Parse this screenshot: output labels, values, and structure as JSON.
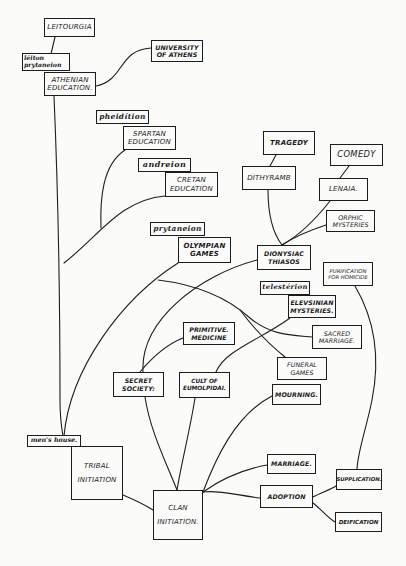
{
  "diagram": {
    "type": "genealogy-tree of Greek social institutions",
    "colors": {
      "ink": "#1c1c1c",
      "paper": "#fbfbfa"
    },
    "nodes": {
      "leitourgia": "LEITOURGIA",
      "leiton_prytaneion": "léiton\nprytaneion",
      "athenian_education": "ATHENIAN\nEDUCATION.",
      "university_of_athens": "UNIVERSITY\nOF ATHENS",
      "pheiditon": "pheidítion",
      "spartan_education": "SPARTAN\nEDUCATION",
      "andreion": "andreion",
      "cretan_education": "CRETAN\nEDUCATION",
      "prytaneion": "prytaneion",
      "olympian_games": "OLYMPIAN\nGAMES",
      "tragedy": "TRAGEDY",
      "dithyramb": "DITHYRAMB",
      "comedy": "COMEDY",
      "lenaia": "LENAIA.",
      "orphic_mysteries": "ORPHIC\nMYSTERIES",
      "dionysiac_thiasos": "DIONYSIAC\nTHIASOS",
      "purification_for_homicide": "PURIFICATION\nFOR HOMICIDE",
      "telesterion": "telestérion",
      "elevsinian_mysteries": "ELEVSINIAN\nMYSTERIES.",
      "sacred_marriage": "SACRED\nMARRIAGE.",
      "primitive_medicine": "PRIMITIVE.\nMEDICINE",
      "funeral_games": "FUNERAL\nGAMES",
      "secret_society": "SECRET\nSOCIETY:",
      "cult_of_eumolpidai": "CULT OF\nEUMOLPIDAI.",
      "mourning": "MOURNING.",
      "mens_house": "men's house.",
      "tribal_initiation": "TRIBAL\nINITIATION",
      "marriage": "MARRIAGE.",
      "clan_initiation": "CLAN\nINITIATION.",
      "adoption": "ADOPTION",
      "supplication": "SUPPLICATION.",
      "deification": "DEIFICATION"
    },
    "edges": [
      [
        "leitourgia",
        "athenian_education"
      ],
      [
        "athenian_education",
        "university_of_athens"
      ],
      [
        "athenian_education",
        "mens_house"
      ],
      [
        "spartan_education",
        "mens_house"
      ],
      [
        "cretan_education",
        "mens_house"
      ],
      [
        "olympian_games",
        "mens_house"
      ],
      [
        "tragedy",
        "dithyramb"
      ],
      [
        "dithyramb",
        "dionysiac_thiasos"
      ],
      [
        "comedy",
        "lenaia"
      ],
      [
        "lenaia",
        "dionysiac_thiasos"
      ],
      [
        "orphic_mysteries",
        "dionysiac_thiasos"
      ],
      [
        "dionysiac_thiasos",
        "secret_society"
      ],
      [
        "primitive_medicine",
        "secret_society"
      ],
      [
        "elevsinian_mysteries",
        "cult_of_eumolpidai"
      ],
      [
        "sacred_marriage",
        "funeral_games"
      ],
      [
        "funeral_games",
        "olympian_games"
      ],
      [
        "secret_society",
        "clan_initiation"
      ],
      [
        "cult_of_eumolpidai",
        "clan_initiation"
      ],
      [
        "tribal_initiation",
        "clan_initiation"
      ],
      [
        "mourning",
        "clan_initiation"
      ],
      [
        "marriage",
        "clan_initiation"
      ],
      [
        "adoption",
        "clan_initiation"
      ],
      [
        "adoption",
        "supplication"
      ],
      [
        "adoption",
        "deification"
      ],
      [
        "purification_for_homicide",
        "supplication"
      ]
    ]
  }
}
